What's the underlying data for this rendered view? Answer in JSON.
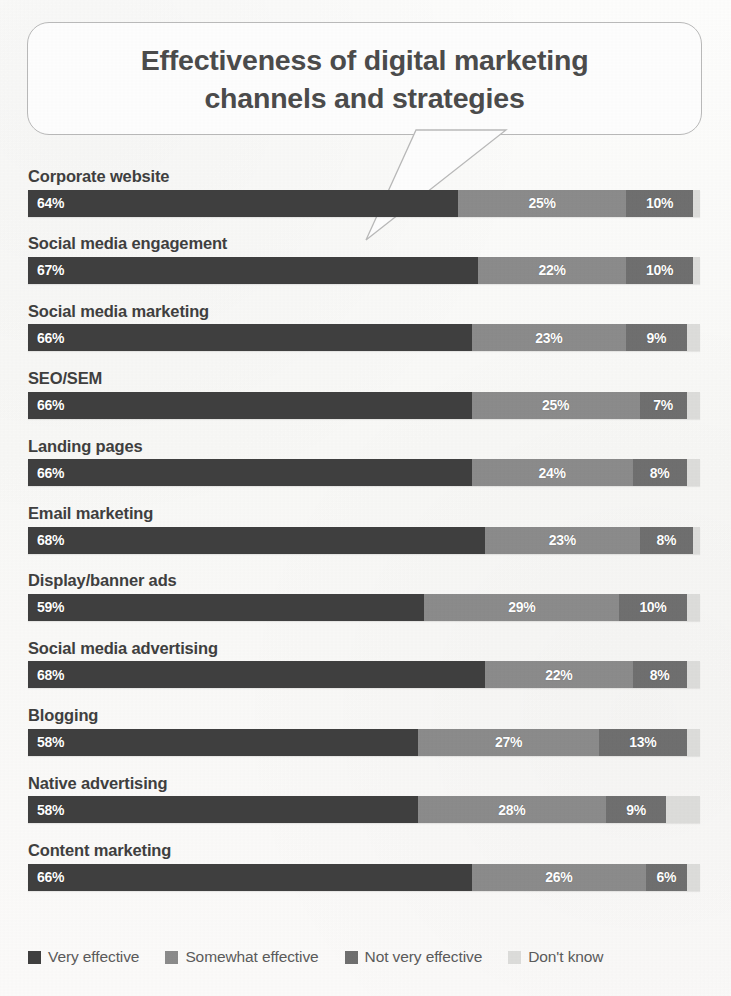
{
  "title": {
    "line1": "Effectiveness of digital marketing",
    "line2": "channels and strategies"
  },
  "colors": {
    "very_effective": "#3f3f3f",
    "somewhat_effective": "#8b8b8b",
    "not_very_effective": "#6f6f6f",
    "dont_know": "#dcdcda",
    "background": "#fbfbfa",
    "label_text": "#3f3f3f",
    "value_text": "#ffffff"
  },
  "legend": {
    "items": [
      {
        "label": "Very effective",
        "color": "#3f3f3f"
      },
      {
        "label": "Somewhat effective",
        "color": "#8b8b8b"
      },
      {
        "label": "Not very effective",
        "color": "#6f6f6f"
      },
      {
        "label": "Don't know",
        "color": "#dcdcda"
      }
    ]
  },
  "chart_data": {
    "type": "bar",
    "subtype": "stacked-horizontal-100",
    "title": "Effectiveness of digital marketing channels and strategies",
    "xlabel": "",
    "ylabel": "",
    "xlim": [
      0,
      100
    ],
    "grid": false,
    "legend_position": "bottom",
    "categories": [
      "Corporate website",
      "Social media engagement",
      "Social media marketing",
      "SEO/SEM",
      "Landing pages",
      "Email marketing",
      "Display/banner ads",
      "Social media advertising",
      "Blogging",
      "Native advertising",
      "Content marketing"
    ],
    "series": [
      {
        "name": "Very effective",
        "color": "#3f3f3f",
        "values": [
          64,
          67,
          66,
          66,
          66,
          68,
          59,
          68,
          58,
          58,
          66
        ]
      },
      {
        "name": "Somewhat effective",
        "color": "#8b8b8b",
        "values": [
          25,
          22,
          23,
          25,
          24,
          23,
          29,
          22,
          27,
          28,
          26
        ]
      },
      {
        "name": "Not very effective",
        "color": "#6f6f6f",
        "values": [
          10,
          10,
          9,
          7,
          8,
          8,
          10,
          8,
          13,
          9,
          6
        ]
      },
      {
        "name": "Don't know",
        "color": "#dcdcda",
        "values": [
          1,
          1,
          2,
          2,
          2,
          1,
          2,
          2,
          2,
          5,
          2
        ]
      }
    ],
    "value_labels": [
      [
        "64%",
        "25%",
        "10%"
      ],
      [
        "67%",
        "22%",
        "10%"
      ],
      [
        "66%",
        "23%",
        "9%"
      ],
      [
        "66%",
        "25%",
        "7%"
      ],
      [
        "66%",
        "24%",
        "8%"
      ],
      [
        "68%",
        "23%",
        "8%"
      ],
      [
        "59%",
        "29%",
        "10%"
      ],
      [
        "68%",
        "22%",
        "8%"
      ],
      [
        "58%",
        "27%",
        "13%"
      ],
      [
        "58%",
        "28%",
        "9%"
      ],
      [
        "66%",
        "26%",
        "6%"
      ]
    ]
  }
}
